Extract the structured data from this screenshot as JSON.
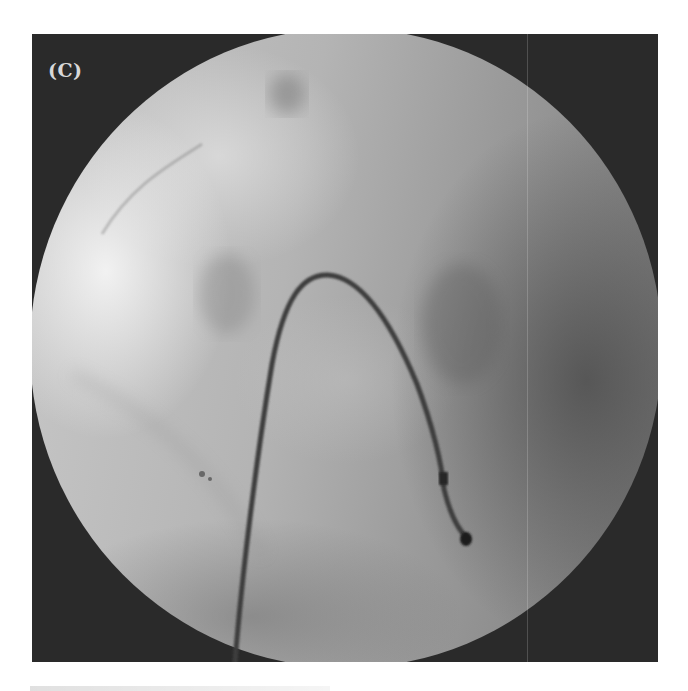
{
  "figure": {
    "panel_label": "(C)",
    "type": "fluoroscopy-image",
    "frame_color": "#2a2a2a"
  }
}
